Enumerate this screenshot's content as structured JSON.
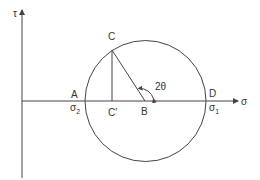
{
  "diagram": {
    "axes": {
      "horizontal_label": "σ",
      "vertical_label": "τ"
    },
    "points": {
      "A": "A",
      "B": "B",
      "C": "C",
      "C_prime": "C′",
      "D": "D"
    },
    "stresses": {
      "sigma2_base": "σ",
      "sigma2_sub": "2",
      "sigma1_base": "σ",
      "sigma1_sub": "1"
    },
    "angle_label": "2θ",
    "colors": {
      "stroke": "#444444",
      "text": "#333333",
      "background": "#ffffff"
    }
  }
}
